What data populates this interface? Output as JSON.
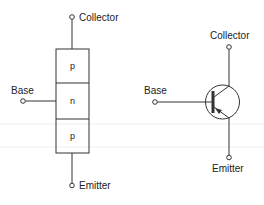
{
  "pnp_layers": {
    "collector_label": "Collector",
    "base_label": "Base",
    "emitter_label": "Emitter",
    "layers": [
      "p",
      "n",
      "p"
    ]
  },
  "pnp_symbol": {
    "collector_label": "Collector",
    "base_label": "Base",
    "emitter_label": "Emitter"
  },
  "colors": {
    "line": "#333333",
    "text": "#222222",
    "artifact": "#e6e6e6"
  }
}
